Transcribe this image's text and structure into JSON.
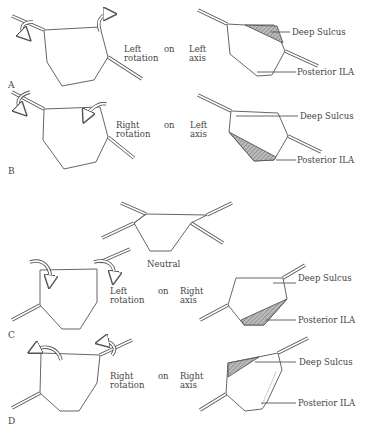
{
  "panels": [
    {
      "letter": "A",
      "direction": "Left",
      "word_on": "on",
      "axis_side": "Left",
      "line2_left": "rotation",
      "line2_right": "axis",
      "labels": {
        "top": "Deep Sulcus",
        "bottom": "Posterior ILA"
      }
    },
    {
      "letter": "B",
      "direction": "Right",
      "word_on": "on",
      "axis_side": "Left",
      "line2_left": "rotation",
      "line2_right": "axis",
      "labels": {
        "top": "Deep Sulcus",
        "bottom": "Posterior ILA"
      }
    },
    {
      "letter": "C",
      "direction": "Left",
      "word_on": "on",
      "axis_side": "Right",
      "line2_left": "rotation",
      "line2_right": "axis",
      "labels": {
        "top": "Deep Sulcus",
        "bottom": "Posterior ILA"
      }
    },
    {
      "letter": "D",
      "direction": "Right",
      "word_on": "on",
      "axis_side": "Right",
      "line2_left": "rotation",
      "line2_right": "axis",
      "labels": {
        "top": "Deep Sulcus",
        "bottom": "Posterior ILA"
      }
    }
  ],
  "neutral": {
    "label": "Neutral"
  },
  "colors": {
    "line": "#555555",
    "hatch": "#888888"
  }
}
